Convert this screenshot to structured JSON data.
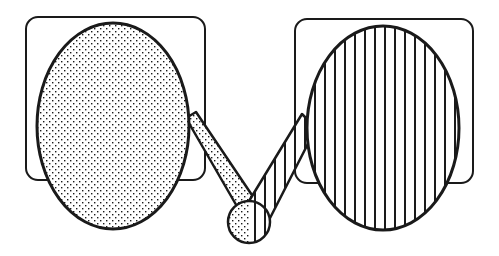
{
  "diagram": {
    "title": "",
    "colors": {
      "ink": "#1a1a1a",
      "paper": "#ffffff"
    },
    "shapes": {
      "left_frame": {
        "kind": "rounded-rect",
        "fill": "none"
      },
      "left_oval": {
        "kind": "ellipse",
        "fill": "dotted"
      },
      "left_arm": {
        "kind": "bar",
        "fill": "dotted"
      },
      "joint": {
        "kind": "circle",
        "fill": "dotted-and-striped"
      },
      "right_arm": {
        "kind": "bar",
        "fill": "vertical-stripes"
      },
      "right_oval": {
        "kind": "ellipse",
        "fill": "vertical-stripes"
      },
      "right_frame": {
        "kind": "rounded-rect",
        "fill": "none"
      }
    }
  }
}
